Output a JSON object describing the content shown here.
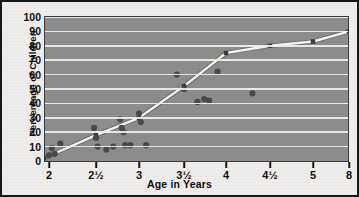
{
  "chart_data": {
    "type": "scatter",
    "title": "",
    "xlabel": "Age in Years",
    "ylabel": "Percentage of Children",
    "grid": true,
    "legend": "none",
    "ylim": [
      0,
      100
    ],
    "yticks": [
      0,
      10,
      20,
      30,
      40,
      50,
      60,
      70,
      80,
      90,
      100
    ],
    "xticklabels": [
      "2",
      "2½",
      "3",
      "3½",
      "4",
      "4½",
      "5",
      "8"
    ],
    "xtickvalues": [
      2,
      2.5,
      3,
      3.5,
      4,
      4.5,
      5,
      8
    ],
    "xtickpositions_px": [
      47,
      94,
      137,
      182,
      224,
      268,
      311,
      347
    ],
    "note": "x axis is compressed between 5 and 8",
    "series": [
      {
        "name": "children",
        "type": "scatter",
        "marker": "circle",
        "color": "#4a4a4c",
        "points": [
          [
            2.0,
            4
          ],
          [
            2.03,
            9
          ],
          [
            2.06,
            5
          ],
          [
            2.12,
            12
          ],
          [
            2.48,
            23
          ],
          [
            2.5,
            16
          ],
          [
            2.52,
            10
          ],
          [
            2.62,
            8
          ],
          [
            2.7,
            10
          ],
          [
            2.78,
            29
          ],
          [
            2.8,
            23
          ],
          [
            2.82,
            20
          ],
          [
            2.84,
            11
          ],
          [
            2.9,
            11
          ],
          [
            3.0,
            33
          ],
          [
            3.02,
            27
          ],
          [
            3.08,
            11
          ],
          [
            3.42,
            60
          ],
          [
            3.5,
            50
          ],
          [
            3.66,
            41
          ],
          [
            3.74,
            43
          ],
          [
            3.8,
            42
          ],
          [
            3.9,
            62
          ],
          [
            4.3,
            47
          ]
        ]
      },
      {
        "name": "fitted-curve",
        "type": "line",
        "color": "#f5f4f2",
        "points": [
          [
            1.95,
            2
          ],
          [
            2.5,
            18
          ],
          [
            3.0,
            30
          ],
          [
            3.5,
            52
          ],
          [
            4.0,
            75
          ],
          [
            4.5,
            80
          ],
          [
            5.0,
            83
          ],
          [
            8.0,
            90
          ]
        ]
      }
    ]
  }
}
